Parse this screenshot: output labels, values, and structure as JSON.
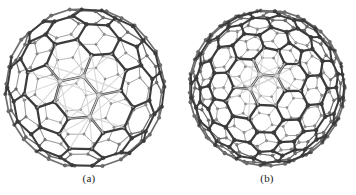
{
  "figure": {
    "background_color": "#ffffff",
    "render_style": "ball-and-stick",
    "color_mode": "grayscale",
    "palette": {
      "bond_far": "#9a9a9a",
      "bond_mid": "#6e6e6e",
      "bond_near": "#3c3c3c",
      "bond_highlight": "#cfcfcf",
      "atom_far": "#8e8e8e",
      "atom_mid": "#6a6a6a",
      "atom_near": "#454545",
      "caption_color": "#1a1a1a"
    },
    "panels": [
      {
        "id": "a",
        "caption": "(a)",
        "cage_type": "pentagon-faceted-cage",
        "center_x": 85,
        "center_y": 88,
        "radius": 78,
        "frequency": 3,
        "hub_vertices": 4,
        "show_radial_hubs": true
      },
      {
        "id": "b",
        "caption": "(b)",
        "cage_type": "hexagon-dominated-cage",
        "center_x": 89,
        "center_y": 88,
        "radius": 76,
        "frequency": 4,
        "hub_vertices": 3,
        "show_radial_hubs": true
      }
    ]
  }
}
